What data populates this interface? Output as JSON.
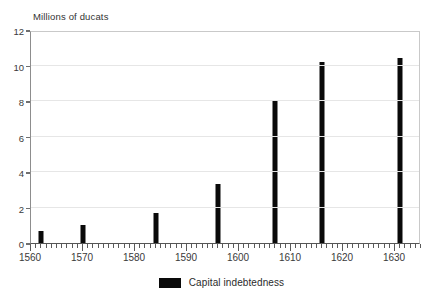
{
  "chart_data": {
    "type": "bar",
    "title": "",
    "subtitle": "",
    "xlabel": "",
    "ylabel": "Millions of ducats",
    "xlim": [
      1560,
      1635
    ],
    "ylim": [
      0,
      12
    ],
    "grid": true,
    "legend_position": "bottom-center",
    "x_tick_labels": [
      "1560",
      "1570",
      "1580",
      "1590",
      "1600",
      "1610",
      "1620",
      "1630"
    ],
    "x_tick_values": [
      1560,
      1570,
      1580,
      1590,
      1600,
      1610,
      1620,
      1630
    ],
    "x_minor_tick_interval": 1,
    "y_tick_labels": [
      "0",
      "2",
      "4",
      "6",
      "8",
      "10",
      "12"
    ],
    "y_tick_values": [
      0,
      2,
      4,
      6,
      8,
      10,
      12
    ],
    "series": [
      {
        "name": "Capital indebtedness",
        "color": "#0a0a0a",
        "x": [
          1562,
          1570,
          1584,
          1596,
          1607,
          1616,
          1631
        ],
        "values": [
          0.7,
          1.0,
          1.7,
          3.3,
          8.0,
          10.2,
          10.4
        ]
      }
    ],
    "legend": [
      {
        "label": "Capital indebtedness",
        "color": "#0a0a0a"
      }
    ]
  }
}
